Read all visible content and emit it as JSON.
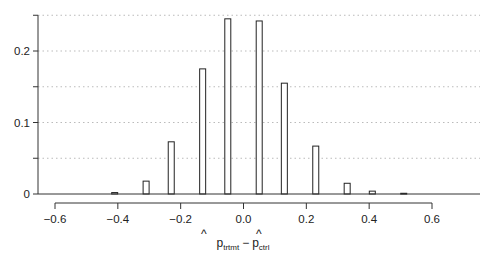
{
  "chart_data": {
    "type": "bar",
    "title": "",
    "xlabel": "p̂_trtmt − p̂_ctrl",
    "xlabel_parts": {
      "hat": "p",
      "sub1": "trtmt",
      "minus": "−",
      "sub2": "ctrl"
    },
    "ylabel": "",
    "xlim": [
      -0.6,
      0.6
    ],
    "ylim": [
      0,
      0.25
    ],
    "x_ticks": [
      -0.6,
      -0.4,
      -0.2,
      0.0,
      0.2,
      0.4,
      0.6
    ],
    "x_tick_labels": [
      "−0.6",
      "−0.4",
      "−0.2",
      "0.0",
      "0.2",
      "0.4",
      "0.6"
    ],
    "y_ticks": [
      0,
      0.05,
      0.1,
      0.15,
      0.2,
      0.25
    ],
    "y_tick_labels": [
      "0",
      "",
      "0.1",
      "",
      "0.2",
      ""
    ],
    "grid": {
      "horizontal": true,
      "style": "dotted",
      "values": [
        0.05,
        0.1,
        0.15,
        0.2,
        0.25
      ]
    },
    "legend": null,
    "x": [
      -0.41,
      -0.31,
      -0.23,
      -0.13,
      -0.05,
      0.05,
      0.13,
      0.23,
      0.33,
      0.41,
      0.51
    ],
    "values": [
      0.002,
      0.018,
      0.073,
      0.175,
      0.245,
      0.242,
      0.155,
      0.067,
      0.015,
      0.004,
      0.001
    ],
    "bar_style": {
      "fill": "#ffffff",
      "stroke": "#222222"
    }
  }
}
